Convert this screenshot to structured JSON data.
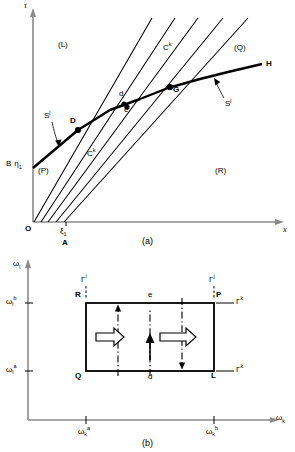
{
  "figure": {
    "panel_a": {
      "caption": "(a)",
      "axis_y_label": "τ",
      "axis_x_label": "x",
      "origin_label": "O",
      "regions": [
        {
          "name": "region-L",
          "label": "(L)"
        },
        {
          "name": "region-Q",
          "label": "(Q)"
        },
        {
          "name": "region-P",
          "label": "(P)"
        },
        {
          "name": "region-R",
          "label": "(R)"
        }
      ],
      "points": [
        {
          "name": "point-D",
          "label": "D"
        },
        {
          "name": "point-d",
          "label": "d"
        },
        {
          "name": "point-e",
          "label": "e"
        },
        {
          "name": "point-G",
          "label": "G"
        },
        {
          "name": "point-H",
          "label": "H"
        }
      ],
      "curve_labels": [
        {
          "name": "shock-left",
          "base": "S",
          "sup": "j"
        },
        {
          "name": "shock-right",
          "base": "S",
          "sup": "j"
        },
        {
          "name": "char-upper",
          "base": "C",
          "sup": "k"
        },
        {
          "name": "char-lower",
          "base": "C",
          "sup": "k"
        }
      ],
      "axis_marks": {
        "b_eta": {
          "b": "B",
          "eta": "η",
          "eta_sub": "1"
        },
        "xi": {
          "xi": "ξ",
          "xi_sub": "1"
        },
        "a_mark": "A"
      }
    },
    "panel_b": {
      "caption": "(b)",
      "axis_y": {
        "base": "ω",
        "sub": "l"
      },
      "axis_x": {
        "base": "ω",
        "sub": "k"
      },
      "y_ticks": [
        {
          "name": "omega-l-b",
          "base": "ω",
          "sub": "l",
          "sup": "b"
        },
        {
          "name": "omega-l-a",
          "base": "ω",
          "sub": "l",
          "sup": "a"
        }
      ],
      "x_ticks": [
        {
          "name": "omega-k-a",
          "base": "ω",
          "sub": "k",
          "sup": "a"
        },
        {
          "name": "omega-k-b",
          "base": "ω",
          "sub": "k",
          "sup": "b"
        }
      ],
      "corners": [
        {
          "name": "corner-R",
          "label": "R"
        },
        {
          "name": "corner-P",
          "label": "P"
        },
        {
          "name": "corner-Q",
          "label": "Q"
        },
        {
          "name": "corner-L",
          "label": "L"
        }
      ],
      "interior_points": [
        {
          "name": "point-e",
          "label": "e"
        },
        {
          "name": "point-d",
          "label": "d"
        }
      ],
      "boundary_labels": [
        {
          "name": "gamma-i-top-left",
          "base": "Γ",
          "sup": "i"
        },
        {
          "name": "gamma-j-top-right",
          "base": "Γ",
          "sup": "j"
        },
        {
          "name": "gamma-k-upper-right",
          "base": "Γ",
          "sup": "k"
        },
        {
          "name": "gamma-k-lower-right",
          "base": "Γ",
          "sup": "k"
        }
      ]
    }
  },
  "colors": {
    "stroke": "#000000",
    "axis": "#808080",
    "background": "#ffffff"
  }
}
